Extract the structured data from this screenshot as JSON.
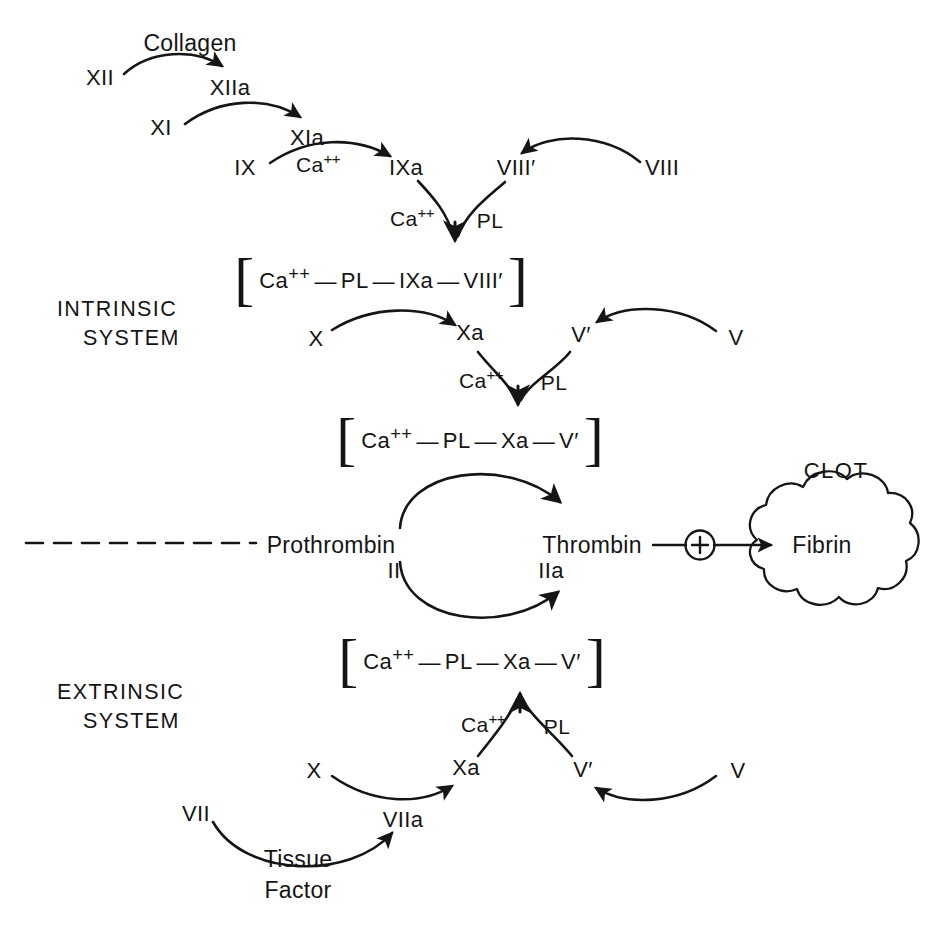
{
  "diagram": {
    "background_color": "#ffffff",
    "ink_color": "#151515",
    "width": 927,
    "height": 939
  },
  "sections": {
    "intrinsic": {
      "line1": "INTRINSIC",
      "line2": "SYSTEM"
    },
    "extrinsic": {
      "line1": "EXTRINSIC",
      "line2": "SYSTEM"
    }
  },
  "intrinsic": {
    "collagen": "Collagen",
    "factor_xii": "XII",
    "factor_xiia": "XIIa",
    "factor_xi": "XI",
    "factor_xia": "XIa",
    "factor_ix": "IX",
    "factor_ixa": "IXa",
    "calcium_ix": "Ca",
    "calcium_ix_charge": "++",
    "factor_viii_prime": "VIII′",
    "factor_viii": "VIII",
    "calcium_tenase": "Ca",
    "calcium_tenase_charge": "++",
    "pl_tenase": "PL",
    "complex_tenase": {
      "bracket_left": "[",
      "bracket_right": "]",
      "part1": "Ca",
      "part1_charge": "++",
      "part2": "PL",
      "part3": "IXa",
      "part4": "VIII′",
      "dash": "—"
    },
    "factor_x": "X",
    "factor_xa": "Xa",
    "factor_v_prime": "V′",
    "factor_v": "V",
    "calcium_prothrombinase": "Ca",
    "calcium_prothrombinase_charge": "++",
    "pl_prothrombinase": "PL",
    "complex_prothrombinase": {
      "bracket_left": "[",
      "bracket_right": "]",
      "part1": "Ca",
      "part1_charge": "++",
      "part2": "PL",
      "part3": "Xa",
      "part4": "V′",
      "dash": "—"
    }
  },
  "common": {
    "prothrombin": "Prothrombin",
    "prothrombin_numeral": "II",
    "thrombin": "Thrombin",
    "thrombin_numeral": "IIa",
    "plus_sign": "+",
    "fibrin": "Fibrin",
    "clot": "CLOT"
  },
  "extrinsic": {
    "complex_prothrombinase": {
      "bracket_left": "[",
      "bracket_right": "]",
      "part1": "Ca",
      "part1_charge": "++",
      "part2": "PL",
      "part3": "Xa",
      "part4": "V′",
      "dash": "—"
    },
    "calcium": "Ca",
    "calcium_charge": "++",
    "pl": "PL",
    "factor_x": "X",
    "factor_xa": "Xa",
    "factor_v_prime": "V′",
    "factor_v": "V",
    "factor_vii": "VII",
    "factor_viia": "VIIa",
    "tissue_factor_line1": "Tissue",
    "tissue_factor_line2": "Factor"
  }
}
